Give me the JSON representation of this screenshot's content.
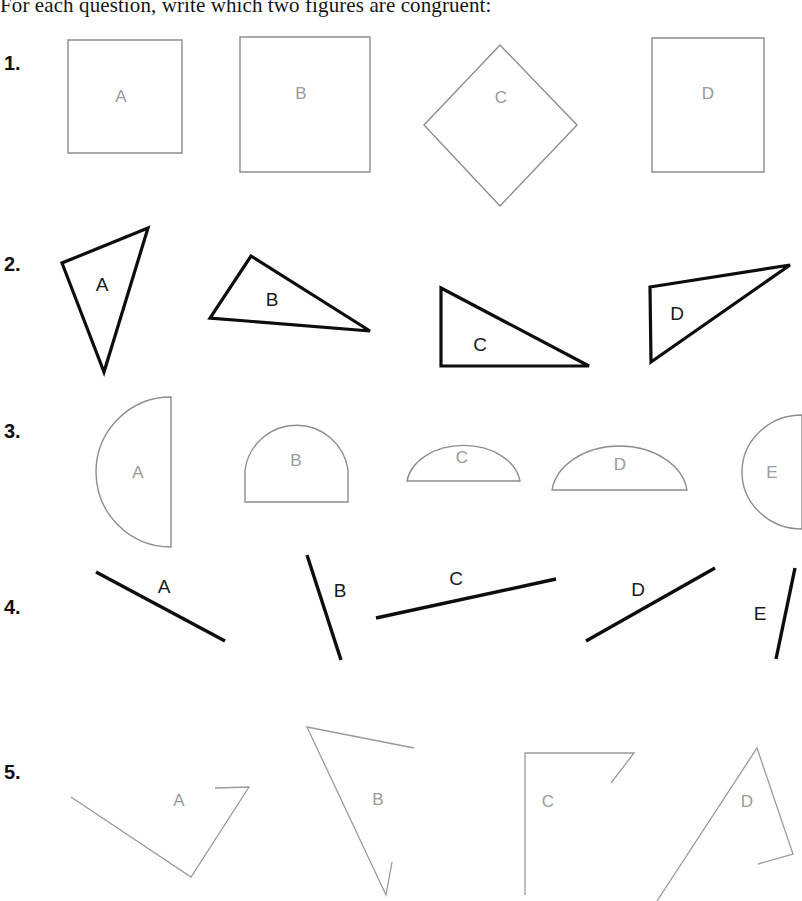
{
  "page": {
    "title": "For each question, write which two figures are congruent:",
    "background_color": "#ffffff",
    "width": 802,
    "height": 901
  },
  "style": {
    "thin_stroke_color": "#8d8d8d",
    "thick_stroke_color": "#0d0d0d",
    "light_label_color": "#9a9a9a",
    "dark_label_color": "#1a1a1a",
    "number_color": "#111111"
  },
  "questions": [
    {
      "number": "1.",
      "number_x": 4,
      "number_y": 52,
      "kind": "quadrilaterals",
      "stroke": "thin",
      "label_class": "light",
      "figures": [
        {
          "label": "A",
          "shape": "square",
          "points": "68,40 182,40 182,153 68,153",
          "label_x": 121,
          "label_y": 102
        },
        {
          "label": "B",
          "shape": "square",
          "points": "240,37 370,37 370,172 240,172",
          "label_x": 301,
          "label_y": 99
        },
        {
          "label": "C",
          "shape": "diamond",
          "points": "500,45 577,125 500,206 424,125",
          "label_x": 501,
          "label_y": 103
        },
        {
          "label": "D",
          "shape": "square",
          "points": "652,38 764,38 764,172 652,172",
          "label_x": 708,
          "label_y": 99
        }
      ]
    },
    {
      "number": "2.",
      "number_x": 4,
      "number_y": 253,
      "kind": "triangles",
      "stroke": "thick",
      "label_class": "dark",
      "figures": [
        {
          "label": "A",
          "shape": "triangle",
          "points": "148,228 62,263 104,372",
          "label_x": 102,
          "label_y": 291
        },
        {
          "label": "B",
          "shape": "triangle",
          "points": "251,256 370,331 210,318",
          "label_x": 272,
          "label_y": 306
        },
        {
          "label": "C",
          "shape": "triangle",
          "points": "441,288 589,366 441,366",
          "label_x": 480,
          "label_y": 351
        },
        {
          "label": "D",
          "shape": "triangle",
          "points": "650,287 790,265 651,362",
          "label_x": 677,
          "label_y": 320
        }
      ]
    },
    {
      "number": "3.",
      "number_x": 4,
      "number_y": 420,
      "kind": "semicircles",
      "stroke": "thin",
      "label_class": "light",
      "figures": [
        {
          "label": "A",
          "shape": "semicircle-left",
          "path": "M 171,397 A 75 75 0 0 0 171,547 Z",
          "label_x": 138,
          "label_y": 478
        },
        {
          "label": "B",
          "shape": "dome",
          "path": "M 245,502 L 245,470 A 52 52 0 0 1 348,470 L 348,502 Z",
          "label_x": 296,
          "label_y": 466
        },
        {
          "label": "C",
          "shape": "semicircle-up",
          "path": "M 407,481 A 57 41 0 0 1 520,481 Z",
          "label_x": 462,
          "label_y": 463
        },
        {
          "label": "D",
          "shape": "semicircle-up",
          "path": "M 552,490 A 68 50 0 0 1 687,490 Z",
          "label_x": 620,
          "label_y": 470
        },
        {
          "label": "E",
          "shape": "semicircle-left",
          "path": "M 802,415 A 60 57 0 0 0 802,529 Z",
          "label_x": 772,
          "label_y": 478
        }
      ]
    },
    {
      "number": "4.",
      "number_x": 4,
      "number_y": 596,
      "kind": "segments",
      "stroke": "thick",
      "label_class": "dark",
      "figures": [
        {
          "label": "A",
          "shape": "line",
          "points": "96,572 225,641",
          "label_x": 164,
          "label_y": 593
        },
        {
          "label": "B",
          "shape": "line",
          "points": "307,555 341,660",
          "label_x": 340,
          "label_y": 597
        },
        {
          "label": "C",
          "shape": "line",
          "points": "376,618 556,579",
          "label_x": 456,
          "label_y": 585
        },
        {
          "label": "D",
          "shape": "line",
          "points": "586,641 715,568",
          "label_x": 638,
          "label_y": 596
        },
        {
          "label": "E",
          "shape": "line",
          "points": "795,568 776,659",
          "label_x": 760,
          "label_y": 620
        }
      ]
    },
    {
      "number": "5.",
      "number_x": 4,
      "number_y": 761,
      "kind": "open-polylines",
      "stroke": "thin-soft",
      "label_class": "light",
      "figures": [
        {
          "label": "A",
          "shape": "polyline",
          "points": "71,797 191,877 249,787 215,788",
          "label_x": 179,
          "label_y": 806
        },
        {
          "label": "B",
          "shape": "polyline",
          "points": "414,748 307,727 386,895 392,862",
          "label_x": 378,
          "label_y": 805
        },
        {
          "label": "C",
          "shape": "polyline",
          "points": "525,895 525,753 634,753 611,783",
          "label_x": 548,
          "label_y": 807
        },
        {
          "label": "D",
          "shape": "polyline",
          "points": "657,901 757,748 793,854 758,864",
          "label_x": 747,
          "label_y": 807
        }
      ]
    }
  ]
}
